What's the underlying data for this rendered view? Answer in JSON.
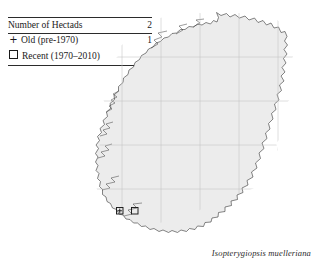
{
  "legend": {
    "header": {
      "label": "Number of Hectads",
      "count": "2"
    },
    "rows": [
      {
        "symbol": "plus-icon",
        "label": "Old  (pre-1970)",
        "count": "1"
      },
      {
        "symbol": "square-icon",
        "label": "Recent (1970–2010)",
        "count": "2"
      }
    ]
  },
  "map": {
    "region_name": "Ireland",
    "land_fill": "#ececec",
    "coastline_color": "#3a3a3a",
    "grid_color": "#c2c2c2",
    "grid_visible": true,
    "records": [
      {
        "type": "old-and-recent",
        "label": "hectad-record-old-recent"
      },
      {
        "type": "recent",
        "label": "hectad-record-recent"
      }
    ]
  },
  "caption": {
    "species": "Isopterygiopsis muelleriana"
  }
}
